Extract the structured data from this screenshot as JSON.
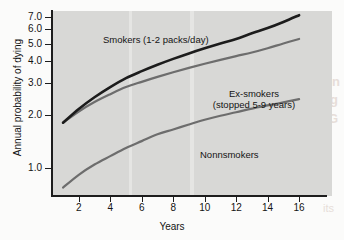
{
  "chart_data": {
    "type": "line",
    "title": "",
    "xlabel": "Years",
    "ylabel": "Annual probability of dying",
    "xlim": [
      0.3,
      17.2
    ],
    "ylim": [
      0.7,
      7.6
    ],
    "yscale": "log",
    "grid": false,
    "legend_position": "inline-annotations",
    "xticks": [
      2,
      4,
      6,
      8,
      10,
      12,
      14,
      16
    ],
    "xtick_labels": [
      "2",
      "4",
      "6",
      "8",
      "10",
      "12",
      "14",
      "16"
    ],
    "yticks": [
      1.0,
      2.0,
      3.0,
      4.0,
      5.0,
      6.0,
      7.0
    ],
    "ytick_labels": [
      "1.0",
      "2.0",
      "3.0",
      "4.0",
      "5.0",
      "6.0",
      "7.0"
    ],
    "x": [
      1,
      2,
      3,
      4,
      5,
      6,
      7,
      8,
      9,
      10,
      11,
      12,
      13,
      14,
      15,
      16
    ],
    "series": [
      {
        "name": "Smokers (1-2 packs/day)",
        "color": "#1c1c1c",
        "values": [
          1.8,
          2.15,
          2.5,
          2.85,
          3.2,
          3.5,
          3.8,
          4.1,
          4.4,
          4.7,
          5.0,
          5.3,
          5.7,
          6.1,
          6.6,
          7.2
        ]
      },
      {
        "name": "Ex-smokers (stopped 5-9 years)",
        "color": "#6d6d6d",
        "values": [
          1.8,
          2.08,
          2.35,
          2.6,
          2.85,
          3.05,
          3.25,
          3.45,
          3.65,
          3.85,
          4.05,
          4.25,
          4.45,
          4.7,
          5.0,
          5.3
        ]
      },
      {
        "name": "Nonnsmokers",
        "color": "#6d6d6d",
        "values": [
          0.78,
          0.92,
          1.05,
          1.17,
          1.3,
          1.42,
          1.55,
          1.65,
          1.76,
          1.87,
          1.97,
          2.06,
          2.16,
          2.25,
          2.34,
          2.44
        ]
      }
    ],
    "annotations": [
      {
        "id": "smokers",
        "text": "Smokers (1-2 packs/day)"
      },
      {
        "id": "exsmokers_line1",
        "text": "Ex-smokers"
      },
      {
        "id": "exsmokers_line2",
        "text": "(stopped 5-9 years)"
      },
      {
        "id": "nonsmokers",
        "text": "Nonnsmokers"
      }
    ],
    "colors": {
      "plot_background": "#d8d8d6",
      "page_background": "#fbfbfa",
      "axis": "#1d1d1d",
      "text": "#141414"
    }
  },
  "axis": {
    "x_title": "Years",
    "y_title": "Annual probability of dying"
  },
  "bleedthrough": {
    "line1": "Cessation",
    "line2": "oking",
    "line3": "MOKING",
    "line4": "its"
  }
}
